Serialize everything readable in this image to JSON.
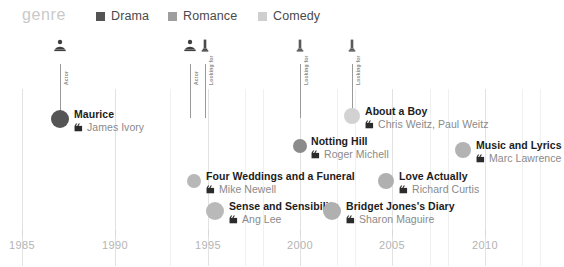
{
  "legend": {
    "title": "genre",
    "items": [
      {
        "label": "Drama",
        "color": "#545454",
        "x": 96
      },
      {
        "label": "Romance",
        "color": "#9e9e9e",
        "x": 168
      },
      {
        "label": "Comedy",
        "color": "#cfcfcf",
        "x": 258
      }
    ]
  },
  "axis": {
    "ticks": [
      {
        "label": "1985",
        "x": 22
      },
      {
        "label": "1990",
        "x": 115
      },
      {
        "label": "1995",
        "x": 208
      },
      {
        "label": "2000",
        "x": 300
      },
      {
        "label": "2005",
        "x": 392
      },
      {
        "label": "2010",
        "x": 485
      }
    ]
  },
  "gridlines": [
    {
      "x": 22,
      "minor": false
    },
    {
      "x": 115,
      "minor": false
    },
    {
      "x": 208,
      "minor": false
    },
    {
      "x": 300,
      "minor": false
    },
    {
      "x": 392,
      "minor": false
    },
    {
      "x": 485,
      "minor": false
    },
    {
      "x": 170,
      "minor": true
    },
    {
      "x": 245,
      "minor": true
    },
    {
      "x": 263,
      "minor": true
    },
    {
      "x": 337,
      "minor": true
    },
    {
      "x": 355,
      "minor": true
    },
    {
      "x": 430,
      "minor": true
    },
    {
      "x": 448,
      "minor": true
    },
    {
      "x": 522,
      "minor": true
    },
    {
      "x": 540,
      "minor": true
    }
  ],
  "actor_markers": [
    {
      "name": "Actor",
      "icon": "actor-icon",
      "x": 60,
      "icon_color": "#3f3f3f",
      "stem_top": 30,
      "stem_height": 54,
      "label_top": 23
    },
    {
      "name": "Actor",
      "icon": "actor-icon",
      "x": 190,
      "icon_color": "#3f3f3f",
      "stem_top": 30,
      "stem_height": 54,
      "label_top": 23
    },
    {
      "name": "Looking for",
      "icon": "award-icon",
      "x": 205,
      "icon_color": "#4a4a4a",
      "stem_top": 30,
      "stem_height": 54,
      "label_top": 23
    },
    {
      "name": "Looking for",
      "icon": "award-icon",
      "x": 300,
      "icon_color": "#5a5a5a",
      "stem_top": 30,
      "stem_height": 54,
      "label_top": 23
    },
    {
      "name": "Looking for",
      "icon": "award-icon",
      "x": 352,
      "icon_color": "#5a5a5a",
      "stem_top": 30,
      "stem_height": 54,
      "label_top": 23
    }
  ],
  "films": [
    {
      "title": "Maurice",
      "director": "James Ivory",
      "genre": "Drama",
      "color": "#555555",
      "dot_x": 60,
      "dot_y": 85,
      "dot_r": 9,
      "text_x": 74,
      "text_y": 74
    },
    {
      "title": "About a Boy",
      "director": "Chris Weitz, Paul Weitz",
      "genre": "Comedy",
      "color": "#d2d2d2",
      "dot_x": 352,
      "dot_y": 82,
      "dot_r": 8,
      "text_x": 365,
      "text_y": 71
    },
    {
      "title": "Notting Hill",
      "director": "Roger Michell",
      "genre": "Drama",
      "color": "#8b8b8b",
      "dot_x": 300,
      "dot_y": 112,
      "dot_r": 7,
      "text_x": 311,
      "text_y": 101
    },
    {
      "title": "Music and Lyrics",
      "director": "Marc Lawrence",
      "genre": "Romance",
      "color": "#b3b3b3",
      "dot_x": 463,
      "dot_y": 116,
      "dot_r": 8,
      "text_x": 476,
      "text_y": 105
    },
    {
      "title": "Four Weddings and a Funeral",
      "director": "Mike Newell",
      "genre": "Comedy",
      "color": "#b8b8b8",
      "dot_x": 194,
      "dot_y": 147,
      "dot_r": 7,
      "text_x": 206,
      "text_y": 136
    },
    {
      "title": "Love Actually",
      "director": "Richard Curtis",
      "genre": "Romance",
      "color": "#b0b0b0",
      "dot_x": 386,
      "dot_y": 147,
      "dot_r": 8,
      "text_x": 399,
      "text_y": 136
    },
    {
      "title": "Sense and Sensibility",
      "director": "Ang Lee",
      "genre": "Romance",
      "color": "#b9b9b9",
      "dot_x": 215,
      "dot_y": 177,
      "dot_r": 9,
      "text_x": 229,
      "text_y": 166
    },
    {
      "title": "Bridget Jones's Diary",
      "director": "Sharon Maguire",
      "genre": "Romance",
      "color": "#b0b0b0",
      "dot_x": 332,
      "dot_y": 177,
      "dot_r": 9,
      "text_x": 346,
      "text_y": 166
    }
  ]
}
